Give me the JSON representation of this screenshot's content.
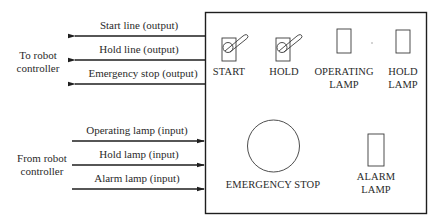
{
  "left_groups": {
    "to_controller": {
      "line1": "To robot",
      "line2": "controller"
    },
    "from_controller": {
      "line1": "From robot",
      "line2": "controller"
    }
  },
  "output_signals": [
    {
      "label": "Start line (output)",
      "direction": "left"
    },
    {
      "label": "Hold line (output)",
      "direction": "left"
    },
    {
      "label": "Emergency stop (output)",
      "direction": "left"
    }
  ],
  "input_signals": [
    {
      "label": "Operating lamp (input)",
      "direction": "right"
    },
    {
      "label": "Hold lamp (input)",
      "direction": "right"
    },
    {
      "label": "Alarm lamp (input)",
      "direction": "right"
    }
  ],
  "panel": {
    "switches": [
      {
        "label": "START",
        "icon": "toggle-switch-icon"
      },
      {
        "label": "HOLD",
        "icon": "toggle-switch-icon"
      }
    ],
    "lamps": [
      {
        "line1": "OPERATING",
        "line2": "LAMP",
        "icon": "lamp-icon"
      },
      {
        "line1": "HOLD",
        "line2": "LAMP",
        "icon": "lamp-icon"
      },
      {
        "line1": "ALARM",
        "line2": "LAMP",
        "icon": "lamp-icon"
      }
    ],
    "emergency_stop": {
      "label": "EMERGENCY STOP",
      "icon": "emergency-stop-button-icon"
    }
  }
}
